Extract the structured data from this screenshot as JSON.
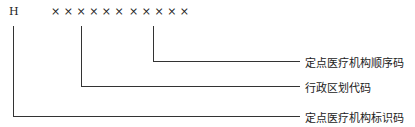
{
  "diagram": {
    "code": {
      "prefix": "H",
      "region_placeholder": "× × × × × ×",
      "sequence_placeholder": "× × × × ×"
    },
    "labels": [
      {
        "text": "定点医疗机构顺序码",
        "points_to": "sequence_placeholder"
      },
      {
        "text": "行政区划代码",
        "points_to": "region_placeholder"
      },
      {
        "text": "定点医疗机构标识码",
        "points_to": "prefix"
      }
    ]
  }
}
